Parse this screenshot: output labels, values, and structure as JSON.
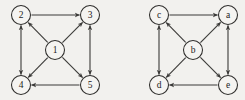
{
  "figure": {
    "background_color": "#f2f1ee",
    "edge_color": "#3b3a38",
    "node_fill_color": "#f5f4f1",
    "node_stroke_color": "#2e2d2b",
    "label_color": "#1c1b1a",
    "width": 245,
    "height": 100
  },
  "graphs": [
    {
      "id": "left-graph",
      "name": "numbered-digraph",
      "nodes": [
        {
          "id": "n2",
          "label": "2",
          "cx": 21,
          "cy": 15,
          "r": 9.5
        },
        {
          "id": "n3",
          "label": "3",
          "cx": 90,
          "cy": 15,
          "r": 9.5
        },
        {
          "id": "n4",
          "label": "4",
          "cx": 21,
          "cy": 85,
          "r": 9.5
        },
        {
          "id": "n5",
          "label": "5",
          "cx": 90,
          "cy": 85,
          "r": 9.5
        },
        {
          "id": "n1",
          "label": "1",
          "cx": 55,
          "cy": 50,
          "r": 9.5
        }
      ],
      "edges": [
        {
          "from": "n2",
          "to": "n3",
          "direction": "one-way"
        },
        {
          "from": "n5",
          "to": "n4",
          "direction": "one-way"
        },
        {
          "from": "n2",
          "to": "n4",
          "direction": "two-way"
        },
        {
          "from": "n3",
          "to": "n5",
          "direction": "two-way"
        },
        {
          "from": "n1",
          "to": "n2",
          "direction": "one-way"
        },
        {
          "from": "n1",
          "to": "n3",
          "direction": "one-way"
        },
        {
          "from": "n1",
          "to": "n4",
          "direction": "one-way"
        },
        {
          "from": "n1",
          "to": "n5",
          "direction": "one-way"
        }
      ]
    },
    {
      "id": "right-graph",
      "name": "lettered-digraph",
      "nodes": [
        {
          "id": "c",
          "label": "c",
          "cx": 159,
          "cy": 15,
          "r": 9.5
        },
        {
          "id": "a",
          "label": "a",
          "cx": 228,
          "cy": 15,
          "r": 9.5
        },
        {
          "id": "d",
          "label": "d",
          "cx": 159,
          "cy": 85,
          "r": 9.5
        },
        {
          "id": "e",
          "label": "e",
          "cx": 228,
          "cy": 85,
          "r": 9.5
        },
        {
          "id": "b",
          "label": "b",
          "cx": 193,
          "cy": 50,
          "r": 9.5
        }
      ],
      "edges": [
        {
          "from": "c",
          "to": "a",
          "direction": "one-way"
        },
        {
          "from": "e",
          "to": "d",
          "direction": "one-way"
        },
        {
          "from": "c",
          "to": "d",
          "direction": "two-way"
        },
        {
          "from": "a",
          "to": "e",
          "direction": "two-way"
        },
        {
          "from": "b",
          "to": "c",
          "direction": "one-way"
        },
        {
          "from": "b",
          "to": "a",
          "direction": "one-way"
        },
        {
          "from": "b",
          "to": "d",
          "direction": "one-way"
        },
        {
          "from": "b",
          "to": "e",
          "direction": "one-way"
        }
      ]
    }
  ]
}
